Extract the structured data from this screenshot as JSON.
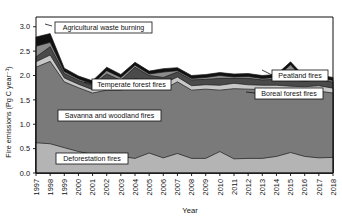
{
  "chart_data": {
    "type": "area",
    "title": "",
    "xlabel": "Year",
    "ylabel": "Fire emissions (Pg C year⁻¹)",
    "ylim": [
      0.0,
      3.2
    ],
    "yticks": [
      0.0,
      0.5,
      1.0,
      1.5,
      2.0,
      2.5,
      3.0
    ],
    "ytick_labels": [
      "0.0",
      "0.5",
      "1.0",
      "1.5",
      "2.0",
      "2.5",
      "3.0"
    ],
    "xlim": [
      1997,
      2018
    ],
    "grid": false,
    "legend_position": "inline-callouts",
    "stacked": true,
    "categories": [
      1997,
      1998,
      1999,
      2000,
      2001,
      2002,
      2003,
      2004,
      2005,
      2006,
      2007,
      2008,
      2009,
      2010,
      2011,
      2012,
      2013,
      2014,
      2015,
      2016,
      2017,
      2018
    ],
    "xtick_labels": [
      "1997",
      "1998",
      "1999",
      "2000",
      "2001",
      "2002",
      "2003",
      "2004",
      "2005",
      "2006",
      "2007",
      "2008",
      "2009",
      "2010",
      "2011",
      "2012",
      "2013",
      "2014",
      "2015",
      "2016",
      "2017",
      "2018"
    ],
    "series": [
      {
        "name": "Deforestation fires",
        "color": "#b4b4b4",
        "values": [
          0.62,
          0.6,
          0.52,
          0.44,
          0.38,
          0.34,
          0.34,
          0.3,
          0.41,
          0.31,
          0.4,
          0.3,
          0.3,
          0.44,
          0.29,
          0.3,
          0.3,
          0.34,
          0.42,
          0.34,
          0.31,
          0.32
        ]
      },
      {
        "name": "Savanna and woodland fires",
        "color": "#7a7a7a",
        "values": [
          1.55,
          1.69,
          1.35,
          1.31,
          1.26,
          1.36,
          1.36,
          1.52,
          1.39,
          1.4,
          1.47,
          1.4,
          1.42,
          1.26,
          1.44,
          1.42,
          1.41,
          1.36,
          1.25,
          1.33,
          1.37,
          1.32
        ]
      },
      {
        "name": "Temperate forest fires",
        "color": "#c8c8c8",
        "values": [
          0.11,
          0.13,
          0.08,
          0.07,
          0.07,
          0.11,
          0.09,
          0.11,
          0.08,
          0.12,
          0.1,
          0.09,
          0.09,
          0.1,
          0.11,
          0.09,
          0.09,
          0.1,
          0.11,
          0.1,
          0.11,
          0.1
        ]
      },
      {
        "name": "Boreal forest fires",
        "color": "#4a4a4a",
        "values": [
          0.1,
          0.17,
          0.09,
          0.08,
          0.09,
          0.22,
          0.11,
          0.24,
          0.12,
          0.13,
          0.1,
          0.12,
          0.11,
          0.14,
          0.1,
          0.13,
          0.11,
          0.12,
          0.14,
          0.11,
          0.13,
          0.12
        ]
      },
      {
        "name": "Peatland fires",
        "color": "#8c8c8c",
        "values": [
          0.22,
          0.09,
          0.04,
          0.03,
          0.03,
          0.07,
          0.06,
          0.04,
          0.03,
          0.11,
          0.03,
          0.03,
          0.04,
          0.06,
          0.03,
          0.04,
          0.03,
          0.04,
          0.3,
          0.03,
          0.03,
          0.04
        ]
      },
      {
        "name": "Agricultural waste burning",
        "color": "#111111",
        "values": [
          0.19,
          0.18,
          0.07,
          0.06,
          0.06,
          0.07,
          0.06,
          0.06,
          0.06,
          0.07,
          0.06,
          0.06,
          0.06,
          0.06,
          0.06,
          0.06,
          0.06,
          0.06,
          0.06,
          0.06,
          0.06,
          0.06
        ]
      }
    ],
    "annotations": [
      {
        "label": "Agricultural waste burning",
        "x": 55,
        "y": 22,
        "w": 97,
        "h": 11,
        "leader_x1": 52,
        "leader_y1": 26,
        "leader_x2": 45,
        "leader_y2": 24
      },
      {
        "label": "Temperate forest fires",
        "x": 92,
        "y": 79,
        "w": 79,
        "h": 11,
        "leader_x1": 92,
        "leader_y1": 84,
        "leader_x2": 84,
        "leader_y2": 82
      },
      {
        "label": "Savanna and woodland fires",
        "x": 58,
        "y": 110,
        "w": 103,
        "h": 11,
        "leader_x1": 0,
        "leader_y1": 0,
        "leader_x2": 0,
        "leader_y2": 0
      },
      {
        "label": "Deforestation  fires",
        "x": 56,
        "y": 153,
        "w": 72,
        "h": 11,
        "leader_x1": 0,
        "leader_y1": 0,
        "leader_x2": 0,
        "leader_y2": 0
      },
      {
        "label": "Peatland fires",
        "x": 272,
        "y": 70,
        "w": 56,
        "h": 11,
        "leader_x1": 272,
        "leader_y1": 75,
        "leader_x2": 262,
        "leader_y2": 70
      },
      {
        "label": "Boreal forest fires",
        "x": 255,
        "y": 88,
        "w": 68,
        "h": 11,
        "leader_x1": 255,
        "leader_y1": 93,
        "leader_x2": 246,
        "leader_y2": 92
      }
    ]
  }
}
